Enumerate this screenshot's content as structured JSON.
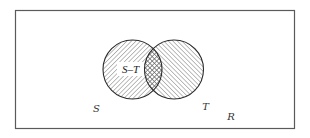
{
  "diagram": {
    "type": "venn",
    "universe": {
      "label": "R",
      "frame": {
        "x": 15,
        "y": 10,
        "width": 280,
        "height": 119
      },
      "stroke": "#555555"
    },
    "sets": [
      {
        "id": "S",
        "label": "S",
        "cx": 132.5,
        "cy": 69.5,
        "r": 29.5,
        "hatch": "forward-diagonal"
      },
      {
        "id": "T",
        "label": "T",
        "cx": 174,
        "cy": 69.5,
        "r": 29.5,
        "hatch": "backward-diagonal"
      }
    ],
    "intersection": {
      "hatch": "cross-hatch"
    },
    "region_labels": [
      {
        "text": "S–T",
        "region": "S minus T"
      }
    ],
    "labels": {
      "s": "S",
      "t": "T",
      "r": "R",
      "s_minus_t": "S–T"
    },
    "colors": {
      "outline": "#2a2a2a",
      "hatch": "#555555",
      "frame": "#555555",
      "background": "#ffffff"
    }
  }
}
